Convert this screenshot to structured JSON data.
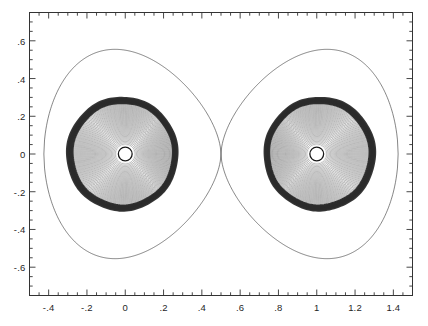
{
  "figure": {
    "background_color": "#ffffff",
    "frame_color": "#333333",
    "contour_color": "#2b2b2b"
  },
  "chart_data": {
    "type": "line",
    "title": "",
    "subtitle": "",
    "xlabel": "",
    "ylabel": "",
    "xlim": [
      -0.5,
      1.5
    ],
    "ylim": [
      -0.75,
      0.75
    ],
    "grid": false,
    "legend": null,
    "x_ticks": [
      -0.4,
      -0.2,
      0,
      0.2,
      0.4,
      0.6,
      0.8,
      1,
      1.2,
      1.4
    ],
    "x_tick_labels": [
      "-.4",
      "-.2",
      "0",
      ".2",
      ".4",
      ".6",
      ".8",
      "1",
      "1.2",
      "1.4"
    ],
    "y_ticks": [
      0.6,
      0.4,
      0.2,
      0,
      -0.2,
      -0.4,
      -0.6
    ],
    "y_tick_labels": [
      ".6",
      ".4",
      ".2",
      "0",
      "-.2",
      "-.4",
      "-.6"
    ],
    "x_minor_tick_step": 0.05,
    "y_minor_tick_step": 0.05,
    "tick_direction": "in",
    "series": [
      {
        "name": "left-lobe-contours",
        "kind": "nested-closed-contours",
        "center": [
          0.0,
          0.0
        ],
        "count": 46,
        "inner_radius": 0.035,
        "outer_radius_x": 0.285,
        "outer_radius_y": 0.295,
        "dark_band_at": 0.96
      },
      {
        "name": "right-lobe-contours",
        "kind": "nested-closed-contours",
        "center": [
          1.0,
          0.0
        ],
        "count": 46,
        "inner_radius": 0.035,
        "outer_radius_x": 0.285,
        "outer_radius_y": 0.295,
        "dark_band_at": 0.96
      },
      {
        "name": "left-star-surface",
        "kind": "circle",
        "center": [
          0.0,
          0.0
        ],
        "radius": 0.036
      },
      {
        "name": "right-star-surface",
        "kind": "circle",
        "center": [
          1.0,
          0.0
        ],
        "radius": 0.036
      },
      {
        "name": "critical-roche-surface",
        "kind": "figure-eight",
        "crossing_point": [
          0.5,
          0.0
        ],
        "left_extent": -0.425,
        "right_extent": 1.425,
        "max_y": 0.375,
        "min_y": -0.375
      }
    ]
  }
}
